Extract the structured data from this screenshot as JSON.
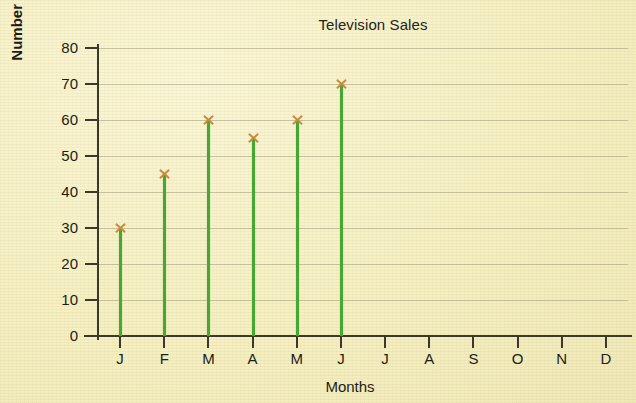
{
  "chart_data": {
    "type": "bar",
    "title": "Television Sales",
    "xlabel": "Months",
    "ylabel": "Number Sold",
    "categories": [
      "J",
      "F",
      "M",
      "A",
      "M",
      "J",
      "J",
      "A",
      "S",
      "O",
      "N",
      "D"
    ],
    "values": [
      30,
      45,
      60,
      55,
      60,
      70,
      null,
      null,
      null,
      null,
      null,
      null
    ],
    "ylim": [
      0,
      80
    ],
    "yticks": [
      0,
      10,
      20,
      30,
      40,
      50,
      60,
      70,
      80
    ],
    "ytick_labels": [
      "0",
      "10",
      "20",
      "30",
      "40",
      "50",
      "60",
      "70",
      "80"
    ],
    "grid": true,
    "legend": "none",
    "marker": "x",
    "colors": {
      "background": "#f6f1c6",
      "stem": "#46a832",
      "marker": "#c78a3e",
      "axis": "#3b382b",
      "gridline": "#78735a",
      "text": "#1d1d17"
    }
  }
}
